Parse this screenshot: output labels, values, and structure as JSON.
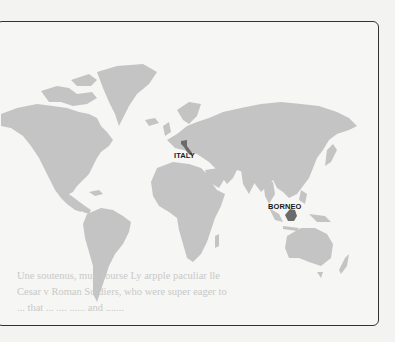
{
  "figure": {
    "type": "world-map",
    "land_color": "#c4c4c4",
    "highlight_color": "#6e6e6e",
    "border_color": "#333333",
    "background_color": "#f6f6f4"
  },
  "labels": {
    "italy": "ITALY",
    "borneo": "BORNEO"
  },
  "bleed_through_text": {
    "line1": "... ...... ..... ...... ... ....... ........",
    "line2": "... ........ ...... ..... ...... ....... .....",
    "line3": "Une soutenus, muy course Ly arpple paculiar lle",
    "line4": "Cesar v Roman Soldiers, who were super eager to",
    "line5": "... that ... ....  ...... and ......."
  }
}
